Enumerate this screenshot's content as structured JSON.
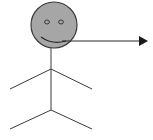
{
  "diagram": {
    "type": "stick-figure-actor",
    "colors": {
      "background": "#ffffff",
      "head_fill": "#a6a6a6",
      "stroke": "#3a3a3a",
      "arrow": "#1a1a1a"
    },
    "figure": {
      "head": {
        "cx": 54,
        "cy": 25,
        "r": 23,
        "expression": "smile"
      },
      "body": {
        "x": 51,
        "y1": 48,
        "y2": 110
      },
      "arms": {
        "junction_y": 69,
        "left_x": 10,
        "right_x": 92,
        "end_y": 89
      },
      "legs": {
        "junction_y": 110,
        "left_x": 10,
        "right_x": 92,
        "end_y": 129
      }
    },
    "arrow": {
      "x1": 62,
      "y1": 41,
      "x2": 148,
      "y2": 41,
      "direction": "right"
    }
  }
}
